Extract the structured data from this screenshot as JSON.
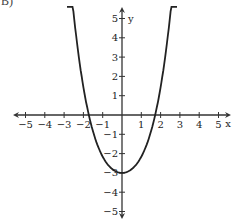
{
  "label": "B)",
  "chart_data": {
    "type": "line",
    "title": "",
    "xlabel": "x",
    "ylabel": "y",
    "xlim": [
      -5.5,
      5.5
    ],
    "ylim": [
      -5.5,
      5.5
    ],
    "grid": false,
    "xticks": [
      -5,
      -4,
      -3,
      -2,
      -1,
      1,
      2,
      3,
      4,
      5
    ],
    "yticks": [
      5,
      4,
      3,
      2,
      1,
      -1,
      -2,
      -3,
      -4,
      -5
    ],
    "series": [
      {
        "name": "parabola",
        "equation": "y = x^2 - 3 (approx. sketch, vertex (0,-3), x-intercepts near ±2)",
        "x": [
          -2.8,
          -2.5,
          -2,
          -1.5,
          -1,
          -0.5,
          0,
          0.5,
          1,
          1.5,
          2,
          2.5,
          2.8
        ],
        "y": [
          5.4,
          3.6,
          0,
          -1.5,
          -2.3,
          -2.8,
          -3,
          -2.8,
          -2.3,
          -1.5,
          0,
          3.6,
          5.4
        ]
      }
    ]
  }
}
